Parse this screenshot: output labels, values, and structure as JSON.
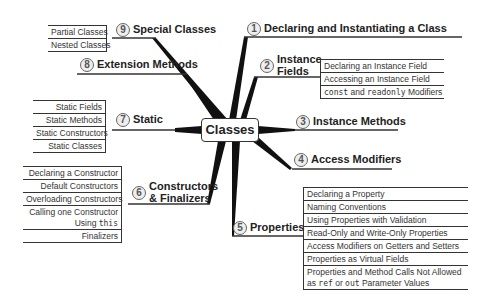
{
  "center": {
    "label": "Classes"
  },
  "topics": [
    {
      "num": "1",
      "label": "Declaring and Instantiating a Class",
      "subitems": []
    },
    {
      "num": "2",
      "label_line1": "Instance",
      "label_line2": "Fields",
      "subitems": [
        "Declaring an Instance Field",
        "Accessing an Instance Field"
      ],
      "subitem_mixed": {
        "code1": "const",
        "text1": " and ",
        "code2": "readonly",
        "text2": " Modifiers"
      }
    },
    {
      "num": "3",
      "label": "Instance Methods",
      "subitems": []
    },
    {
      "num": "4",
      "label": "Access Modifiers",
      "subitems": []
    },
    {
      "num": "5",
      "label": "Properties",
      "subitems": [
        "Declaring a Property",
        "Naming Conventions",
        "Using Properties with Validation",
        "Read-Only and Write-Only Properties",
        "Access Modifiers on Getters and Setters",
        "Properties as Virtual Fields",
        "Properties and Method Calls Not Allowed"
      ],
      "subitem_last": {
        "text1": "as ",
        "code1": "ref",
        "text2": " or ",
        "code2": "out",
        "text3": " Parameter Values"
      }
    },
    {
      "num": "6",
      "label_line1": "Constructors",
      "label_line2": "& Finalizers",
      "subitems": [
        "Declaring a Constructor",
        "Default Constructors",
        "Overloading Constructors",
        "Calling one Constructor",
        "Finalizers"
      ],
      "subitem_mixed": {
        "text1": "Using ",
        "code1": "this"
      }
    },
    {
      "num": "7",
      "label": "Static",
      "subitems": [
        "Static Fields",
        "Static Methods",
        "Static Constructors",
        "Static Classes"
      ]
    },
    {
      "num": "8",
      "label": "Extension Methods",
      "subitems": []
    },
    {
      "num": "9",
      "label": "Special Classes",
      "subitems": [
        "Partial Classes",
        "Nested Classes"
      ]
    }
  ]
}
